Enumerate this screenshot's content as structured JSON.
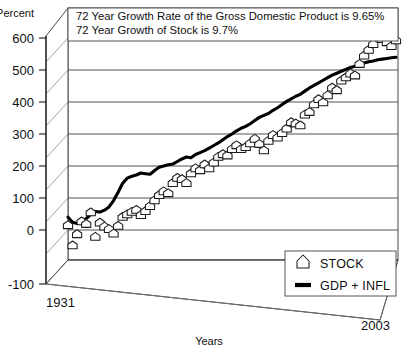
{
  "axes": {
    "y_unit_label": "Percent",
    "y_ticks": [
      "600",
      "500",
      "400",
      "300",
      "200",
      "100",
      "0",
      "-100"
    ],
    "x_start_label": "1931",
    "x_end_label": "2003",
    "x_axis_title": "Years"
  },
  "annotation": {
    "line1": "72 Year Growth Rate of the Gross Domestic Product is 9.65%",
    "line2": "72 Year Growth of Stock is 9.7%"
  },
  "legend": {
    "items": [
      {
        "label": "STOCK",
        "marker": "house-pentagon-marker-icon"
      },
      {
        "label": "GDP + INFL",
        "marker": "thick-line-swatch-icon"
      }
    ]
  },
  "colors": {
    "gdp_line": "#000000",
    "marker_fill": "#ffffff",
    "marker_stroke": "#1a1a1a",
    "grid": "#3f3f3f",
    "wall": "#4a4a4a",
    "background": "#ffffff"
  },
  "chart_data": {
    "type": "scatter",
    "title": "",
    "subtitle": "",
    "xlabel": "Years",
    "ylabel": "Percent",
    "xlim": [
      1931,
      2003
    ],
    "ylim": [
      -100,
      640
    ],
    "grid": true,
    "legend_position": "bottom-right",
    "yticks": [
      -100,
      0,
      100,
      200,
      300,
      400,
      500,
      600
    ],
    "x": [
      1931,
      1932,
      1933,
      1934,
      1935,
      1936,
      1937,
      1938,
      1939,
      1940,
      1941,
      1942,
      1943,
      1944,
      1945,
      1946,
      1947,
      1948,
      1949,
      1950,
      1951,
      1952,
      1953,
      1954,
      1955,
      1956,
      1957,
      1958,
      1959,
      1960,
      1961,
      1962,
      1963,
      1964,
      1965,
      1966,
      1967,
      1968,
      1969,
      1970,
      1971,
      1972,
      1973,
      1974,
      1975,
      1976,
      1977,
      1978,
      1979,
      1980,
      1981,
      1982,
      1983,
      1984,
      1985,
      1986,
      1987,
      1988,
      1989,
      1990,
      1991,
      1992,
      1993,
      1994,
      1995,
      1996,
      1997,
      1998,
      1999,
      2000,
      2001,
      2002,
      2003
    ],
    "series": [
      {
        "name": "STOCK",
        "marker": "house-pentagon",
        "values": [
          18,
          -45,
          -10,
          30,
          22,
          58,
          -18,
          26,
          14,
          6,
          -8,
          16,
          44,
          52,
          60,
          66,
          50,
          62,
          78,
          96,
          112,
          124,
          118,
          150,
          166,
          162,
          150,
          180,
          196,
          190,
          208,
          196,
          214,
          232,
          240,
          236,
          256,
          268,
          256,
          262,
          274,
          288,
          272,
          252,
          282,
          300,
          292,
          306,
          320,
          340,
          336,
          330,
          364,
          372,
          396,
          412,
          402,
          424,
          448,
          440,
          470,
          480,
          492,
          486,
          522,
          548,
          566,
          584,
          612,
          600,
          590,
          578,
          596
        ]
      },
      {
        "name": "GDP + INFL",
        "marker": "none",
        "values": [
          40,
          24,
          20,
          26,
          36,
          48,
          58,
          56,
          62,
          72,
          92,
          118,
          146,
          162,
          168,
          172,
          178,
          176,
          174,
          186,
          196,
          200,
          204,
          206,
          214,
          222,
          228,
          226,
          236,
          242,
          248,
          256,
          264,
          272,
          282,
          292,
          300,
          310,
          318,
          324,
          332,
          342,
          352,
          358,
          364,
          374,
          382,
          392,
          402,
          410,
          418,
          424,
          434,
          444,
          452,
          460,
          468,
          476,
          484,
          490,
          496,
          502,
          508,
          512,
          518,
          522,
          526,
          528,
          532,
          534,
          536,
          538,
          540
        ]
      }
    ],
    "annotations": [
      "72 Year Growth Rate of the Gross Domestic Product is 9.65%",
      "72 Year Growth of Stock is 9.7%"
    ]
  }
}
